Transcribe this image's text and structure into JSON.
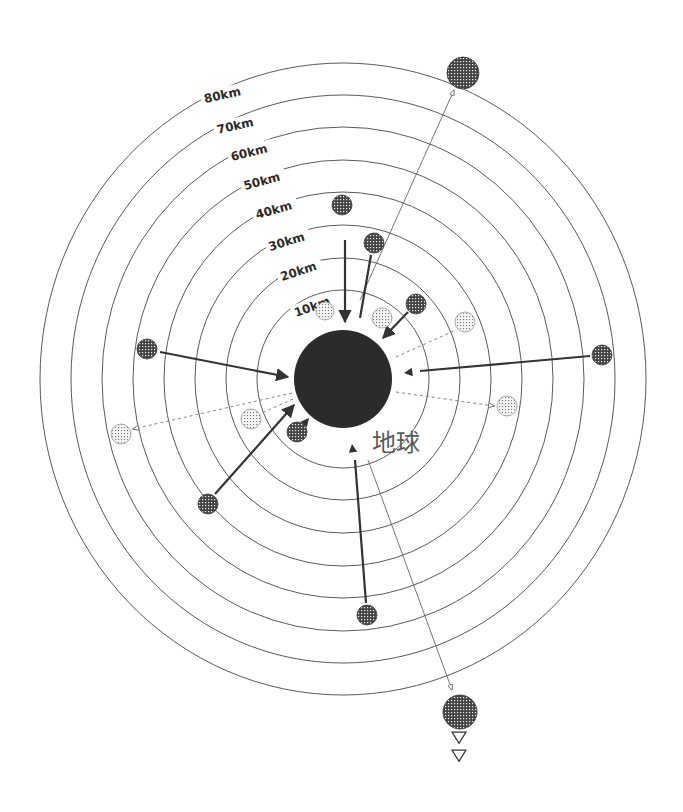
{
  "diagram": {
    "title": "",
    "center": {
      "x": 343,
      "y": 379
    },
    "earth": {
      "label": "地球",
      "radius": 49,
      "label_x": 372,
      "label_y": 451
    },
    "rings": [
      {
        "label": "10km",
        "rx": 86,
        "ry": 89,
        "label_x": 296,
        "label_y": 317,
        "angle": -20,
        "size": 12
      },
      {
        "label": "20km",
        "rx": 117,
        "ry": 121,
        "label_x": 282,
        "label_y": 281,
        "angle": -18,
        "size": 12
      },
      {
        "label": "30km",
        "rx": 148,
        "ry": 154,
        "label_x": 270,
        "label_y": 251,
        "angle": -17,
        "size": 12
      },
      {
        "label": "40km",
        "rx": 179,
        "ry": 187,
        "label_x": 257,
        "label_y": 219,
        "angle": -16,
        "size": 12
      },
      {
        "label": "50km",
        "rx": 210,
        "ry": 219,
        "label_x": 245,
        "label_y": 190,
        "angle": -15,
        "size": 12
      },
      {
        "label": "60km",
        "rx": 241,
        "ry": 252,
        "label_x": 232,
        "label_y": 161,
        "angle": -14,
        "size": 12
      },
      {
        "label": "70km",
        "rx": 272,
        "ry": 284,
        "label_x": 218,
        "label_y": 134,
        "angle": -13,
        "size": 12
      },
      {
        "label": "80km",
        "rx": 303,
        "ry": 316,
        "label_x": 205,
        "label_y": 103,
        "angle": -12,
        "size": 12
      }
    ],
    "objects": [
      {
        "id": "obj-top-far",
        "x": 463,
        "y": 73,
        "r": 16,
        "pattern": "dense"
      },
      {
        "id": "obj-40km-top",
        "x": 342,
        "y": 205,
        "r": 10,
        "pattern": "dense"
      },
      {
        "id": "obj-30km-top",
        "x": 374,
        "y": 243,
        "r": 10,
        "pattern": "dense"
      },
      {
        "id": "obj-10km-a",
        "x": 325,
        "y": 311,
        "r": 9,
        "pattern": "light"
      },
      {
        "id": "obj-10km-b",
        "x": 382,
        "y": 318,
        "r": 10,
        "pattern": "light"
      },
      {
        "id": "obj-20km-ne",
        "x": 416,
        "y": 304,
        "r": 10,
        "pattern": "dense"
      },
      {
        "id": "obj-30km-e",
        "x": 465,
        "y": 322,
        "r": 10,
        "pattern": "light"
      },
      {
        "id": "obj-west-60km",
        "x": 147,
        "y": 349,
        "r": 10,
        "pattern": "dense"
      },
      {
        "id": "obj-east-80km",
        "x": 602,
        "y": 355,
        "r": 10,
        "pattern": "dense"
      },
      {
        "id": "obj-east-30km",
        "x": 507,
        "y": 406,
        "r": 10,
        "pattern": "light"
      },
      {
        "id": "obj-west-80km",
        "x": 121,
        "y": 434,
        "r": 10,
        "pattern": "light"
      },
      {
        "id": "obj-west-20km",
        "x": 251,
        "y": 419,
        "r": 10,
        "pattern": "light"
      },
      {
        "id": "obj-sw-10km",
        "x": 297,
        "y": 432,
        "r": 10,
        "pattern": "dense"
      },
      {
        "id": "obj-sw-50km",
        "x": 208,
        "y": 504,
        "r": 10,
        "pattern": "dense"
      },
      {
        "id": "obj-south-60km",
        "x": 367,
        "y": 615,
        "r": 10,
        "pattern": "dense"
      },
      {
        "id": "obj-bottom-far",
        "x": 460,
        "y": 712,
        "r": 17,
        "pattern": "dense"
      }
    ],
    "arrows": [
      {
        "id": "arrow-top-escape",
        "type": "thin",
        "x1": 360,
        "y1": 300,
        "x2": 454,
        "y2": 90,
        "head": "open"
      },
      {
        "id": "arrow-40km-fall",
        "type": "solid",
        "x1": 345,
        "y1": 240,
        "x2": 345,
        "y2": 322,
        "head": "filled"
      },
      {
        "id": "arrow-30km-fall",
        "type": "solid",
        "x1": 371,
        "y1": 255,
        "x2": 360,
        "y2": 318,
        "head": "none"
      },
      {
        "id": "arrow-ne-fall",
        "type": "solid",
        "x1": 408,
        "y1": 312,
        "x2": 383,
        "y2": 338,
        "head": "filled"
      },
      {
        "id": "arrow-e-dashed",
        "type": "dashed",
        "x1": 396,
        "y1": 357,
        "x2": 456,
        "y2": 330,
        "head": "none"
      },
      {
        "id": "arrow-west-fall",
        "type": "solid",
        "x1": 160,
        "y1": 352,
        "x2": 288,
        "y2": 377,
        "head": "filled"
      },
      {
        "id": "arrow-east-fall",
        "type": "solid",
        "x1": 590,
        "y1": 356,
        "x2": 420,
        "y2": 371,
        "head": "none"
      },
      {
        "id": "arrow-east-tip",
        "type": "tri",
        "x1": 412,
        "y1": 372,
        "x2": 404,
        "y2": 373,
        "head": "filled"
      },
      {
        "id": "arrow-e-dashed-2",
        "type": "dashed",
        "x1": 396,
        "y1": 392,
        "x2": 494,
        "y2": 406,
        "head": "open"
      },
      {
        "id": "arrow-west-dashed",
        "type": "dashed",
        "x1": 292,
        "y1": 393,
        "x2": 133,
        "y2": 429,
        "head": "open"
      },
      {
        "id": "arrow-w-dashed-2",
        "type": "dashed",
        "x1": 293,
        "y1": 399,
        "x2": 262,
        "y2": 413,
        "head": "none"
      },
      {
        "id": "arrow-sw-fall",
        "type": "solid",
        "x1": 215,
        "y1": 494,
        "x2": 294,
        "y2": 405,
        "head": "filled"
      },
      {
        "id": "arrow-sw-10km",
        "type": "tri",
        "x1": 304,
        "y1": 424,
        "x2": 309,
        "y2": 418,
        "head": "filled"
      },
      {
        "id": "arrow-south-fall",
        "type": "solid",
        "x1": 366,
        "y1": 603,
        "x2": 355,
        "y2": 460,
        "head": "none"
      },
      {
        "id": "arrow-south-tip",
        "type": "tri",
        "x1": 353,
        "y1": 452,
        "x2": 352,
        "y2": 444,
        "head": "filled"
      },
      {
        "id": "arrow-bottom-escape",
        "type": "thin",
        "x1": 368,
        "y1": 460,
        "x2": 452,
        "y2": 690,
        "head": "open"
      }
    ],
    "bottom_markers": [
      {
        "x": 459,
        "y": 737,
        "label": "▽"
      },
      {
        "x": 459,
        "y": 755,
        "label": "▽"
      }
    ],
    "colors": {
      "ring": "#5a5a5a",
      "earth": "#2b2b2b",
      "ink": "#333333",
      "background": "#ffffff"
    }
  }
}
